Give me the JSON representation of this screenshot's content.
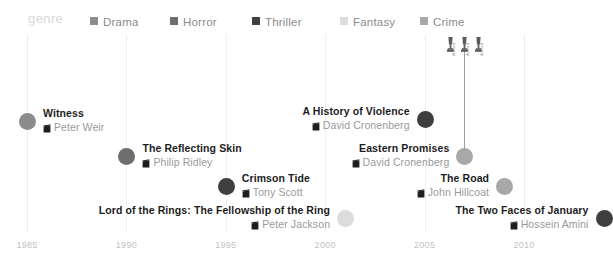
{
  "legend": {
    "title": "genre",
    "items": [
      {
        "label": "Drama",
        "color": "#8c8c8c"
      },
      {
        "label": "Horror",
        "color": "#6e6e6e"
      },
      {
        "label": "Thriller",
        "color": "#3f3f3f"
      },
      {
        "label": "Fantasy",
        "color": "#dcdcdc"
      },
      {
        "label": "Crime",
        "color": "#a8a8a8"
      }
    ]
  },
  "axis": {
    "ticks": [
      "1985",
      "1990",
      "1995",
      "2000",
      "2005",
      "2010"
    ]
  },
  "icons": {
    "slate": "film-slate-icon",
    "trophy": "award-trophy-icon"
  },
  "chart_data": {
    "type": "scatter",
    "title": "genre",
    "xlabel": "",
    "ylabel": "",
    "xlim": [
      1984,
      2015
    ],
    "grid": true,
    "legend_position": "top",
    "categories": [
      "Drama",
      "Horror",
      "Thriller",
      "Fantasy",
      "Crime"
    ],
    "points": [
      {
        "title": "Witness",
        "director": "Peter Weir",
        "year": 1985,
        "genre": "Drama",
        "color": "#8c8c8c",
        "align": "left"
      },
      {
        "title": "The Reflecting Skin",
        "director": "Philip Ridley",
        "year": 1990,
        "genre": "Horror",
        "color": "#6e6e6e",
        "align": "left"
      },
      {
        "title": "Crimson Tide",
        "director": "Tony Scott",
        "year": 1995,
        "genre": "Thriller",
        "color": "#3f3f3f",
        "align": "left"
      },
      {
        "title": "Lord of the Rings: The Fellowship of the Ring",
        "director": "Peter Jackson",
        "year": 2001,
        "genre": "Fantasy",
        "color": "#dcdcdc",
        "align": "right"
      },
      {
        "title": "A History of Violence",
        "director": "David Cronenberg",
        "year": 2005,
        "genre": "Thriller",
        "color": "#3f3f3f",
        "align": "right"
      },
      {
        "title": "Eastern Promises",
        "director": "David Cronenberg",
        "year": 2007,
        "genre": "Crime",
        "color": "#a8a8a8",
        "align": "right"
      },
      {
        "title": "The Road",
        "director": "John Hillcoat",
        "year": 2009,
        "genre": "Crime",
        "color": "#a8a8a8",
        "align": "right"
      },
      {
        "title": "The Two Faces of January",
        "director": "Hossein Amini",
        "year": 2014,
        "genre": "Thriller",
        "color": "#3f3f3f",
        "align": "right"
      }
    ],
    "awards": {
      "film": "Eastern Promises",
      "labels": [
        "Award",
        "Award",
        "Award"
      ]
    }
  }
}
